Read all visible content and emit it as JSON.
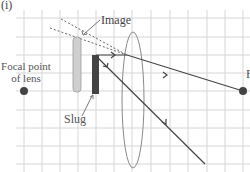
{
  "figure": {
    "part_label": "(i)",
    "labels": {
      "focal_point": "Focal point of lens",
      "image": "Image",
      "slug": "Slug",
      "right_focal": "F"
    },
    "colors": {
      "grid": "#d6d6d6",
      "ray": "#444444",
      "dashed": "#666666",
      "image_bar": "#cfcfcf",
      "slug_bar": "#444444",
      "lens": "#8a8a8a",
      "focal_dot": "#444444"
    },
    "grid": {
      "columns_x": [
        24,
        42,
        60,
        78,
        96,
        114,
        132,
        151,
        170,
        188,
        207,
        225,
        243
      ],
      "rows_y": [
        18,
        37,
        55,
        73,
        91,
        110,
        128,
        146,
        164
      ]
    },
    "elements": {
      "left_focal_point": {
        "x": 24,
        "y": 91
      },
      "right_focal_point": {
        "x": 243,
        "y": 91
      },
      "image_bar": {
        "x": 73,
        "y": 37,
        "width": 8,
        "height": 55
      },
      "slug_bar": {
        "x": 92,
        "y": 55,
        "width": 7,
        "height": 39
      },
      "lens": {
        "cx": 133,
        "cy": 100,
        "rx": 11,
        "ry": 68
      }
    }
  }
}
